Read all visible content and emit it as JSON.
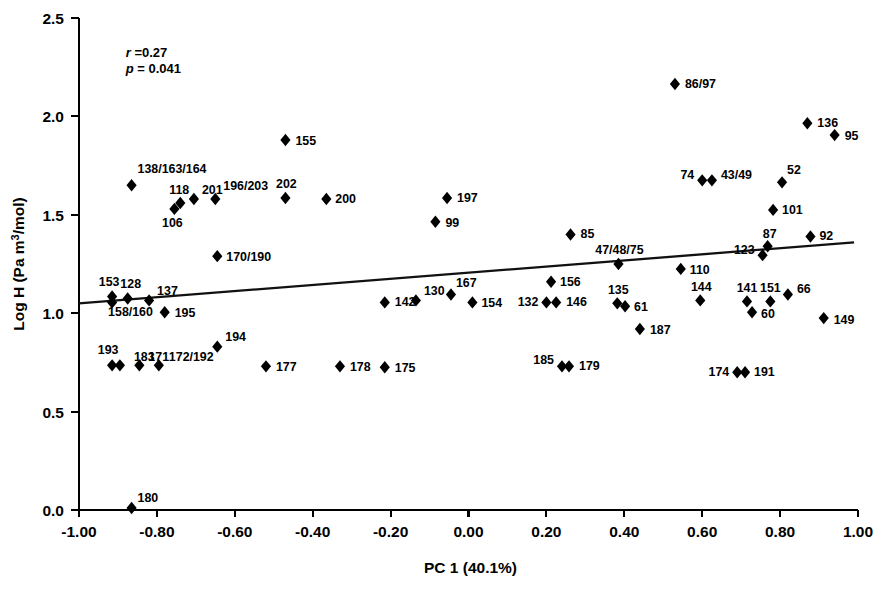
{
  "chart_data": {
    "type": "scatter",
    "title": "",
    "xlabel": "PC 1 (40.1%)",
    "ylabel": "Log H (Pa m³/mol)",
    "ylabel_parts": {
      "pre": "Log H (Pa m",
      "sup": "3",
      "post": "/mol)"
    },
    "xlim": [
      -1.0,
      1.0
    ],
    "ylim": [
      0.0,
      2.5
    ],
    "xticks": [
      -1.0,
      -0.8,
      -0.6,
      -0.4,
      -0.2,
      0.0,
      0.2,
      0.4,
      0.6,
      0.8,
      1.0
    ],
    "xtick_labels": [
      "-1.00",
      "-0.80",
      "-0.60",
      "-0.40",
      "-0.20",
      "0.00",
      "0.20",
      "0.40",
      "0.60",
      "0.80",
      "1.00"
    ],
    "yticks": [
      0.0,
      0.5,
      1.0,
      1.5,
      2.0,
      2.5
    ],
    "ytick_labels": [
      "0.0",
      "0.5",
      "1.0",
      "1.5",
      "2.0",
      "2.5"
    ],
    "grid": false,
    "legend": "none",
    "annotations": [
      {
        "name": "correlation-r",
        "text_italic": "r",
        "text": " =0.27",
        "x": -0.88,
        "y": 2.3
      },
      {
        "name": "p-value",
        "text_italic": "p",
        "text": " = 0.041",
        "x": -0.88,
        "y": 2.22
      }
    ],
    "trendline": {
      "type": "linear",
      "x_start": -1.0,
      "y_start": 1.05,
      "x_end": 0.99,
      "y_end": 1.36
    },
    "marker_style": "filled-diamond",
    "marker_color": "#000000",
    "points": [
      {
        "label": "180",
        "x": -0.865,
        "y": 0.01,
        "lx": 6,
        "ly": -6,
        "anchor": "start"
      },
      {
        "label": "193",
        "x": -0.915,
        "y": 0.735,
        "lx": -4,
        "ly": -11,
        "anchor": "middle"
      },
      {
        "label": "183",
        "x": -0.895,
        "y": 0.735,
        "lx": 14,
        "ly": -4,
        "anchor": "start"
      },
      {
        "label": "171",
        "x": -0.845,
        "y": 0.735,
        "lx": 9,
        "ly": -4,
        "anchor": "start"
      },
      {
        "label": "172/192",
        "x": -0.795,
        "y": 0.735,
        "lx": 10,
        "ly": -4,
        "anchor": "start"
      },
      {
        "label": "158/160",
        "x": -0.915,
        "y": 1.055,
        "lx": -4,
        "ly": 14,
        "anchor": "start"
      },
      {
        "label": "153",
        "x": -0.915,
        "y": 1.085,
        "lx": -3,
        "ly": -10,
        "anchor": "middle"
      },
      {
        "label": "128",
        "x": -0.875,
        "y": 1.075,
        "lx": 3,
        "ly": -10,
        "anchor": "middle"
      },
      {
        "label": "137",
        "x": -0.82,
        "y": 1.065,
        "lx": 8,
        "ly": -5,
        "anchor": "start"
      },
      {
        "label": "195",
        "x": -0.78,
        "y": 1.005,
        "lx": 10,
        "ly": 5,
        "anchor": "start"
      },
      {
        "label": "138/163/164",
        "x": -0.865,
        "y": 1.65,
        "lx": 6,
        "ly": -12,
        "anchor": "start"
      },
      {
        "label": "106",
        "x": -0.755,
        "y": 1.53,
        "lx": -2,
        "ly": 18,
        "anchor": "middle"
      },
      {
        "label": "118",
        "x": -0.74,
        "y": 1.56,
        "lx": -1,
        "ly": -9,
        "anchor": "middle"
      },
      {
        "label": "201",
        "x": -0.705,
        "y": 1.58,
        "lx": 8,
        "ly": -5,
        "anchor": "start"
      },
      {
        "label": "196/203",
        "x": -0.65,
        "y": 1.58,
        "lx": 8,
        "ly": -9,
        "anchor": "start"
      },
      {
        "label": "170/190",
        "x": -0.645,
        "y": 1.29,
        "lx": 9,
        "ly": 5,
        "anchor": "start"
      },
      {
        "label": "194",
        "x": -0.645,
        "y": 0.83,
        "lx": 8,
        "ly": -6,
        "anchor": "start"
      },
      {
        "label": "177",
        "x": -0.52,
        "y": 0.73,
        "lx": 10,
        "ly": 5,
        "anchor": "start"
      },
      {
        "label": "202",
        "x": -0.47,
        "y": 1.585,
        "lx": 1,
        "ly": -10,
        "anchor": "middle"
      },
      {
        "label": "155",
        "x": -0.47,
        "y": 1.88,
        "lx": 10,
        "ly": 5,
        "anchor": "start"
      },
      {
        "label": "200",
        "x": -0.365,
        "y": 1.58,
        "lx": 9,
        "ly": 4,
        "anchor": "start"
      },
      {
        "label": "178",
        "x": -0.33,
        "y": 0.73,
        "lx": 10,
        "ly": 5,
        "anchor": "start"
      },
      {
        "label": "175",
        "x": -0.215,
        "y": 0.725,
        "lx": 10,
        "ly": 5,
        "anchor": "start"
      },
      {
        "label": "142",
        "x": -0.215,
        "y": 1.055,
        "lx": 10,
        "ly": 4,
        "anchor": "start"
      },
      {
        "label": "130",
        "x": -0.135,
        "y": 1.065,
        "lx": 8,
        "ly": -5,
        "anchor": "start"
      },
      {
        "label": "99",
        "x": -0.085,
        "y": 1.465,
        "lx": 10,
        "ly": 5,
        "anchor": "start"
      },
      {
        "label": "197",
        "x": -0.055,
        "y": 1.585,
        "lx": 10,
        "ly": 4,
        "anchor": "start"
      },
      {
        "label": "167",
        "x": -0.045,
        "y": 1.095,
        "lx": 5,
        "ly": -8,
        "anchor": "start"
      },
      {
        "label": "154",
        "x": 0.01,
        "y": 1.055,
        "lx": 9,
        "ly": 5,
        "anchor": "start"
      },
      {
        "label": "132",
        "x": 0.2,
        "y": 1.055,
        "lx": -8,
        "ly": 4,
        "anchor": "end"
      },
      {
        "label": "146",
        "x": 0.225,
        "y": 1.055,
        "lx": 10,
        "ly": 4,
        "anchor": "start"
      },
      {
        "label": "156",
        "x": 0.212,
        "y": 1.16,
        "lx": 9,
        "ly": 4,
        "anchor": "start"
      },
      {
        "label": "185",
        "x": 0.24,
        "y": 0.73,
        "lx": -8,
        "ly": -2,
        "anchor": "end"
      },
      {
        "label": "179",
        "x": 0.258,
        "y": 0.73,
        "lx": 10,
        "ly": 4,
        "anchor": "start"
      },
      {
        "label": "85",
        "x": 0.262,
        "y": 1.4,
        "lx": 10,
        "ly": 4,
        "anchor": "start"
      },
      {
        "label": "135",
        "x": 0.382,
        "y": 1.05,
        "lx": 1,
        "ly": -9,
        "anchor": "middle"
      },
      {
        "label": "61",
        "x": 0.402,
        "y": 1.035,
        "lx": 9,
        "ly": 5,
        "anchor": "start"
      },
      {
        "label": "47/48/75",
        "x": 0.385,
        "y": 1.25,
        "lx": 1,
        "ly": -10,
        "anchor": "middle"
      },
      {
        "label": "187",
        "x": 0.44,
        "y": 0.92,
        "lx": 10,
        "ly": 5,
        "anchor": "start"
      },
      {
        "label": "86/97",
        "x": 0.53,
        "y": 2.165,
        "lx": 10,
        "ly": 4,
        "anchor": "start"
      },
      {
        "label": "110",
        "x": 0.545,
        "y": 1.225,
        "lx": 9,
        "ly": 5,
        "anchor": "start"
      },
      {
        "label": "144",
        "x": 0.595,
        "y": 1.065,
        "lx": 1,
        "ly": -9,
        "anchor": "middle"
      },
      {
        "label": "74",
        "x": 0.6,
        "y": 1.675,
        "lx": -8,
        "ly": -1,
        "anchor": "end"
      },
      {
        "label": "43/49",
        "x": 0.625,
        "y": 1.675,
        "lx": 9,
        "ly": -1,
        "anchor": "start"
      },
      {
        "label": "174",
        "x": 0.69,
        "y": 0.7,
        "lx": -8,
        "ly": 4,
        "anchor": "end"
      },
      {
        "label": "191",
        "x": 0.71,
        "y": 0.7,
        "lx": 9,
        "ly": 4,
        "anchor": "start"
      },
      {
        "label": "141",
        "x": 0.715,
        "y": 1.06,
        "lx": 0,
        "ly": -9,
        "anchor": "middle"
      },
      {
        "label": "60",
        "x": 0.728,
        "y": 1.005,
        "lx": 9,
        "ly": 6,
        "anchor": "start"
      },
      {
        "label": "123",
        "x": 0.755,
        "y": 1.295,
        "lx": -8,
        "ly": -1,
        "anchor": "end"
      },
      {
        "label": "87",
        "x": 0.768,
        "y": 1.34,
        "lx": 2,
        "ly": -8,
        "anchor": "middle"
      },
      {
        "label": "151",
        "x": 0.775,
        "y": 1.06,
        "lx": 0,
        "ly": -9,
        "anchor": "middle"
      },
      {
        "label": "101",
        "x": 0.782,
        "y": 1.525,
        "lx": 9,
        "ly": 4,
        "anchor": "start"
      },
      {
        "label": "52",
        "x": 0.805,
        "y": 1.665,
        "lx": 5,
        "ly": -8,
        "anchor": "start"
      },
      {
        "label": "66",
        "x": 0.82,
        "y": 1.095,
        "lx": 9,
        "ly": -2,
        "anchor": "start"
      },
      {
        "label": "92",
        "x": 0.878,
        "y": 1.39,
        "lx": 9,
        "ly": 4,
        "anchor": "start"
      },
      {
        "label": "136",
        "x": 0.87,
        "y": 1.965,
        "lx": 10,
        "ly": 4,
        "anchor": "start"
      },
      {
        "label": "149",
        "x": 0.912,
        "y": 0.975,
        "lx": 10,
        "ly": 6,
        "anchor": "start"
      },
      {
        "label": "95",
        "x": 0.94,
        "y": 1.905,
        "lx": 10,
        "ly": 5,
        "anchor": "start"
      }
    ]
  }
}
